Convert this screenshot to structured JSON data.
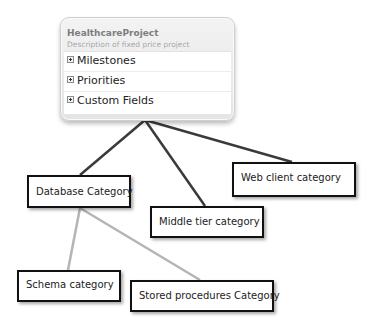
{
  "project": {
    "title": "HealthcareProject",
    "description": "Description of fixed price project",
    "sections": [
      {
        "label": "Milestones",
        "icon": "expand-plus-icon"
      },
      {
        "label": "Priorities",
        "icon": "expand-plus-icon"
      },
      {
        "label": "Custom Fields",
        "icon": "expand-plus-icon"
      }
    ]
  },
  "categories": {
    "database": "Database Category",
    "middle_tier": "Middle tier category",
    "web_client": "Web client category",
    "schema": "Schema category",
    "stored_procedures": "Stored procedures Category"
  },
  "colors": {
    "primary_connector": "#3a3a3a",
    "secondary_connector": "#b5b5b5",
    "box_border": "#111111"
  }
}
